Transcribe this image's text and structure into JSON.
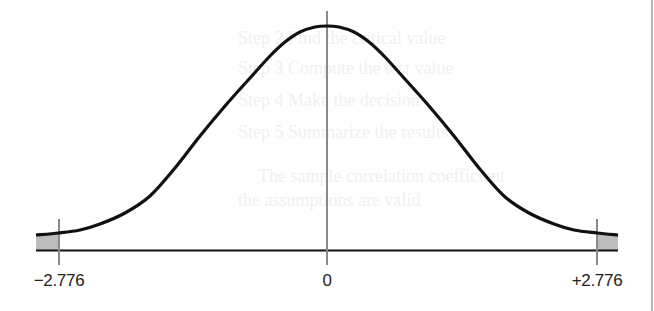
{
  "chart_data": {
    "type": "area",
    "title": "",
    "xlabel": "",
    "ylabel": "",
    "x_ticks": [
      {
        "value": -2.776,
        "label": "−2.776",
        "px": 59
      },
      {
        "value": 0,
        "label": "0",
        "px": 327
      },
      {
        "value": 2.776,
        "label": "+2.776",
        "px": 597
      }
    ],
    "critical_values": [
      -2.776,
      2.776
    ],
    "center": 0,
    "shaded_regions": [
      {
        "from_px": 36,
        "to_px": 59,
        "side": "left"
      },
      {
        "from_px": 597,
        "to_px": 618,
        "side": "right"
      }
    ],
    "curve_points_px": [
      [
        36,
        235
      ],
      [
        59,
        233
      ],
      [
        80,
        230
      ],
      [
        100,
        224
      ],
      [
        125,
        213
      ],
      [
        150,
        196
      ],
      [
        175,
        168
      ],
      [
        200,
        136
      ],
      [
        225,
        106
      ],
      [
        250,
        78
      ],
      [
        270,
        56
      ],
      [
        285,
        42
      ],
      [
        300,
        32
      ],
      [
        315,
        27
      ],
      [
        327,
        26
      ],
      [
        339,
        27
      ],
      [
        354,
        32
      ],
      [
        369,
        42
      ],
      [
        384,
        56
      ],
      [
        404,
        78
      ],
      [
        429,
        106
      ],
      [
        454,
        136
      ],
      [
        479,
        168
      ],
      [
        504,
        196
      ],
      [
        529,
        213
      ],
      [
        554,
        224
      ],
      [
        574,
        230
      ],
      [
        597,
        233
      ],
      [
        618,
        235
      ]
    ],
    "grid": false,
    "legend": null
  },
  "axis": {
    "left_label": "−2.776",
    "center_label": "0",
    "right_label": "+2.776"
  },
  "colors": {
    "curve": "#111111",
    "baseline": "#111111",
    "critical_line": "#8a8a8a",
    "shade": "#bdbdbd",
    "label": "#222222"
  },
  "ghost_text": [
    "Step 2   Find the critical value",
    "Step 3   Compute the test value",
    "Step 4   Make the decision",
    "Step 5   Summarize the results",
    "The sample correlation coefficient",
    "the assumptions are valid",
    "Example for Step 2"
  ]
}
